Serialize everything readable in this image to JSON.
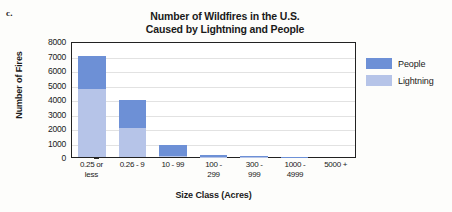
{
  "figure_label": "c.",
  "legend": {
    "position": "right",
    "entries": [
      {
        "name": "People",
        "color": "#6d90d6"
      },
      {
        "name": "Lightning",
        "color": "#b6c4e8"
      }
    ]
  },
  "chart_data": {
    "type": "bar",
    "stacked": true,
    "title": "Number of Wildfires in the U.S. Caused by Lightning and People",
    "title_lines": [
      "Number of Wildfires in the U.S.",
      "Caused by Lightning and People"
    ],
    "xlabel": "Size Class (Acres)",
    "ylabel": "Number of Fires",
    "categories": [
      "0.25 or less",
      "0.26 - 9",
      "10 - 99",
      "100 - 299",
      "300 - 999",
      "1000 - 4999",
      "5000 +"
    ],
    "category_lines": [
      [
        "0.25 or",
        "less"
      ],
      [
        "0.26 - 9",
        ""
      ],
      [
        "10 - 99",
        ""
      ],
      [
        "100 -",
        "299"
      ],
      [
        "300 -",
        "999"
      ],
      [
        "1000 -",
        "4999"
      ],
      [
        "5000 +",
        ""
      ]
    ],
    "series": [
      {
        "name": "Lightning",
        "color": "#b6c4e8",
        "values": [
          4700,
          2000,
          100,
          30,
          10,
          5,
          0
        ]
      },
      {
        "name": "People",
        "color": "#6d90d6",
        "values": [
          2300,
          1900,
          700,
          120,
          40,
          20,
          5
        ]
      }
    ],
    "totals": [
      7000,
      3900,
      800,
      150,
      50,
      25,
      5
    ],
    "ylim": [
      0,
      8000
    ],
    "yticks": [
      0,
      1000,
      2000,
      3000,
      4000,
      5000,
      6000,
      7000,
      8000
    ],
    "ytick_labels": [
      "0",
      "1000",
      "2000",
      "3000",
      "4000",
      "5000",
      "6000",
      "7000",
      "8000"
    ],
    "grid": true
  }
}
